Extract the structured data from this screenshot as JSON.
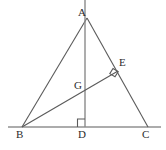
{
  "figure": {
    "background_color": "#ffffff",
    "stroke_color": "#5a5a5a",
    "label_color": "#2b2b2b"
  },
  "labels": {
    "A": "A",
    "B": "B",
    "C": "C",
    "D": "D",
    "E": "E",
    "G": "G"
  },
  "points": {
    "A": {
      "x": 87,
      "y": 18
    },
    "B": {
      "x": 22,
      "y": 127
    },
    "C": {
      "x": 148,
      "y": 127
    },
    "D": {
      "x": 85,
      "y": 127
    },
    "E": {
      "x": 117,
      "y": 72
    },
    "G": {
      "x": 85,
      "y": 88
    },
    "line_top": {
      "x": 85,
      "y": 0
    },
    "base_left_end": {
      "x": 8,
      "y": 127
    },
    "base_right_end": {
      "x": 161,
      "y": 127
    }
  },
  "segments": [
    {
      "name": "segment-AB",
      "from": "A",
      "to": "B"
    },
    {
      "name": "segment-AC",
      "from": "A",
      "to": "C"
    },
    {
      "name": "segment-BC",
      "from": "base_left_end",
      "to": "base_right_end"
    },
    {
      "name": "segment-AD",
      "from": "line_top",
      "to": "D"
    },
    {
      "name": "segment-BE",
      "from": "B",
      "to": "E"
    }
  ],
  "right_angles": [
    {
      "name": "right-angle-at-D",
      "at": "D",
      "note": "AD perpendicular to BC"
    },
    {
      "name": "right-angle-at-E",
      "at": "E",
      "note": "BE perpendicular to AC"
    }
  ]
}
